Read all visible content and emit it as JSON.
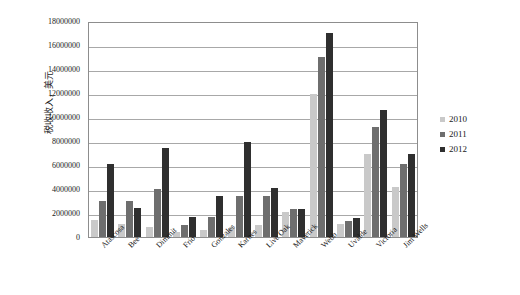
{
  "chart_data": {
    "type": "bar",
    "title": "",
    "xlabel": "",
    "ylabel": "税收收入，美元",
    "ylim": [
      0,
      18000000
    ],
    "ytick_step": 2000000,
    "ytick_labels": [
      "18000000",
      "16000000",
      "14000000",
      "12000000",
      "10000000",
      "8000000",
      "6000000",
      "4000000",
      "2000000",
      "0"
    ],
    "grid": true,
    "legend_position": "right",
    "categories": [
      "Atascosa",
      "Bee",
      "Dimmit",
      "Frio",
      "Gonzales",
      "Karnes",
      "Live Oak",
      "Maverick",
      "Webb",
      "Uvalde",
      "Victoria",
      "Jim Wells"
    ],
    "series": [
      {
        "name": "2010",
        "color": "#c9c9c9",
        "values": [
          1400000,
          1050000,
          850000,
          450000,
          600000,
          780000,
          1000000,
          2050000,
          11900000,
          1120000,
          6950000,
          4150000
        ]
      },
      {
        "name": "2011",
        "color": "#6e6e6e",
        "values": [
          3000000,
          3000000,
          4000000,
          1000000,
          1700000,
          3400000,
          3400000,
          2350000,
          15000000,
          1320000,
          9200000,
          6050000
        ]
      },
      {
        "name": "2012",
        "color": "#2f2f2f",
        "values": [
          6080000,
          2450000,
          7450000,
          1680000,
          3380000,
          7880000,
          4100000,
          2350000,
          17000000,
          1580000,
          10550000,
          6880000
        ]
      }
    ]
  },
  "legend": {
    "entries": [
      {
        "label": "2010"
      },
      {
        "label": "2011"
      },
      {
        "label": "2012"
      }
    ]
  }
}
